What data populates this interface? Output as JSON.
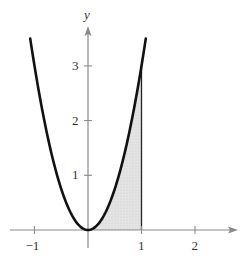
{
  "chart_data": {
    "type": "area",
    "title": "",
    "xlabel": "",
    "ylabel": "y",
    "function": "y = 3x^2",
    "curve": {
      "x": [
        -1.1,
        -1.0,
        -0.75,
        -0.5,
        -0.25,
        0,
        0.25,
        0.5,
        0.75,
        1.0,
        1.08
      ],
      "y": [
        3.5,
        3.0,
        1.69,
        0.75,
        0.19,
        0,
        0.19,
        0.75,
        1.69,
        3.0,
        3.5
      ]
    },
    "shaded_region": {
      "from_x": 0,
      "to_x": 1,
      "description": "region under curve between x=0 and x=1"
    },
    "xticks": [
      -1,
      1,
      2
    ],
    "xtick_labels": [
      "-1",
      "1",
      "2"
    ],
    "yticks": [
      1,
      2,
      3
    ],
    "ytick_labels": [
      "1",
      "2",
      "3"
    ],
    "xlim": [
      -1.5,
      2.5
    ],
    "ylim": [
      -0.3,
      3.8
    ],
    "grid": false,
    "legend": null
  },
  "colors": {
    "curve": "#111111",
    "axis": "#8a8a8a",
    "shade": "#d9d9d9"
  }
}
